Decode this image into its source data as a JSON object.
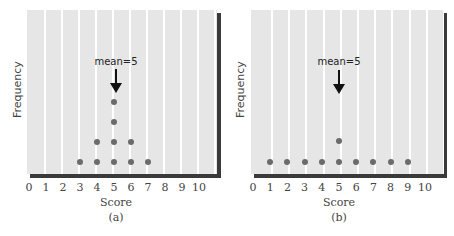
{
  "chart_data": [
    {
      "type": "scatter",
      "subtype": "dot-plot",
      "panel_label": "(a)",
      "xlabel": "Score",
      "ylabel": "Frequency",
      "x_ticks": [
        "0",
        "1",
        "2",
        "3",
        "4",
        "5",
        "6",
        "7",
        "8",
        "9",
        "10"
      ],
      "xlim": [
        0,
        10
      ],
      "annotation": "mean=5",
      "annotation_x": 5,
      "points": [
        {
          "x": 3,
          "count": 1
        },
        {
          "x": 4,
          "count": 2
        },
        {
          "x": 5,
          "count": 4
        },
        {
          "x": 6,
          "count": 2
        },
        {
          "x": 7,
          "count": 1
        }
      ],
      "grid": "vertical lines at each integer score"
    },
    {
      "type": "scatter",
      "subtype": "dot-plot",
      "panel_label": "(b)",
      "xlabel": "Score",
      "ylabel": "Frequency",
      "x_ticks": [
        "0",
        "1",
        "2",
        "3",
        "4",
        "5",
        "6",
        "7",
        "8",
        "9",
        "10"
      ],
      "xlim": [
        0,
        10
      ],
      "annotation": "mean=5",
      "annotation_x": 5,
      "points": [
        {
          "x": 1,
          "count": 1
        },
        {
          "x": 2,
          "count": 1
        },
        {
          "x": 3,
          "count": 1
        },
        {
          "x": 4,
          "count": 1
        },
        {
          "x": 5,
          "count": 2
        },
        {
          "x": 6,
          "count": 1
        },
        {
          "x": 7,
          "count": 1
        },
        {
          "x": 8,
          "count": 1
        },
        {
          "x": 9,
          "count": 1
        }
      ],
      "grid": "vertical lines at each integer score"
    }
  ],
  "panels": [
    {
      "label": "(a)",
      "xlabel": "Score",
      "ylabel": "Frequency",
      "mean_label": "mean=5",
      "ticks": [
        "0",
        "1",
        "2",
        "3",
        "4",
        "5",
        "6",
        "7",
        "8",
        "9",
        "10"
      ],
      "colors": {
        "plot_bg": "#e6e6e6",
        "gridline": "#ffffff",
        "dot": "#6b6b6b",
        "shadow": "#3a3a3a",
        "arrow": "#111111"
      }
    },
    {
      "label": "(b)",
      "xlabel": "Score",
      "ylabel": "Frequency",
      "mean_label": "mean=5",
      "ticks": [
        "0",
        "1",
        "2",
        "3",
        "4",
        "5",
        "6",
        "7",
        "8",
        "9",
        "10"
      ],
      "colors": {
        "plot_bg": "#e6e6e6",
        "gridline": "#ffffff",
        "dot": "#6b6b6b",
        "shadow": "#3a3a3a",
        "arrow": "#111111"
      }
    }
  ]
}
